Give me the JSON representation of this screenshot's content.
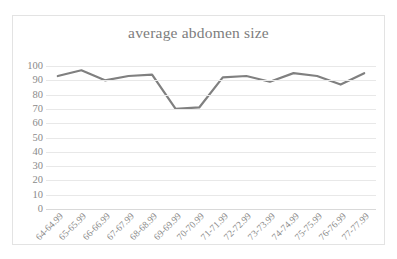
{
  "chart_data": {
    "type": "line",
    "title": "average abdomen size",
    "xlabel": "",
    "ylabel": "",
    "categories": [
      "64-64.99",
      "65-65.99",
      "66-66.99",
      "67-67.99",
      "68-68.99",
      "69-69.99",
      "70-70.99",
      "71-71.99",
      "72-72.99",
      "73-73.99",
      "74-74.99",
      "75-75.99",
      "76-76.99",
      "77-77.99"
    ],
    "values": [
      93,
      97,
      90,
      93,
      94,
      70,
      71,
      92,
      93,
      89,
      95,
      93,
      87,
      95
    ],
    "ylim": [
      0,
      100
    ],
    "ytick_labels": [
      "100",
      "90",
      "80",
      "70",
      "60",
      "50",
      "40",
      "30",
      "20",
      "10",
      "0"
    ],
    "ytick_values": [
      100,
      90,
      80,
      70,
      60,
      50,
      40,
      30,
      20,
      10,
      0
    ],
    "grid": true,
    "legend": false,
    "legend_position": "none",
    "series_color": "#808080",
    "grid_color": "#e8e8e8",
    "title_color": "#7d7d7d",
    "tick_label_color": "#8a8a8a",
    "border_color": "#e3e3e3",
    "background_color": "#ffffff"
  }
}
